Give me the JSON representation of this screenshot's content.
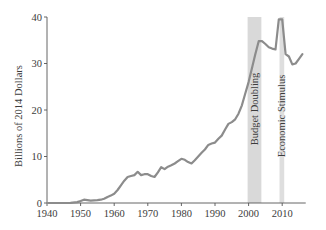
{
  "chart_data": {
    "type": "line",
    "title": "",
    "xlabel": "",
    "ylabel": "Billions of 2014 Dollars",
    "xlim": [
      1940,
      2017
    ],
    "ylim": [
      0,
      40
    ],
    "xticks": [
      1940,
      1950,
      1960,
      1970,
      1980,
      1990,
      2000,
      2010
    ],
    "yticks": [
      0,
      10,
      20,
      30,
      40
    ],
    "grid": false,
    "legend": null,
    "series": [
      {
        "name": "Spending",
        "color": "#8c8c8c",
        "x": [
          1940,
          1945,
          1947,
          1949,
          1950,
          1951,
          1953,
          1955,
          1956,
          1957,
          1958,
          1959,
          1960,
          1961,
          1962,
          1963,
          1964,
          1965,
          1966,
          1967,
          1968,
          1969,
          1970,
          1971,
          1972,
          1973,
          1974,
          1975,
          1976,
          1977,
          1978,
          1979,
          1980,
          1981,
          1982,
          1983,
          1984,
          1985,
          1986,
          1987,
          1988,
          1989,
          1990,
          1991,
          1992,
          1993,
          1994,
          1995,
          1996,
          1997,
          1998,
          1999,
          2000,
          2001,
          2002,
          2003,
          2004,
          2005,
          2006,
          2007,
          2008,
          2009,
          2010,
          2011,
          2012,
          2013,
          2014,
          2015,
          2016
        ],
        "values": [
          0.0,
          0.0,
          0.05,
          0.2,
          0.4,
          0.7,
          0.5,
          0.6,
          0.7,
          0.9,
          1.3,
          1.6,
          2.0,
          2.8,
          3.8,
          4.8,
          5.6,
          5.8,
          6.0,
          6.7,
          6.0,
          6.2,
          6.2,
          5.8,
          5.6,
          6.6,
          7.7,
          7.3,
          7.8,
          8.1,
          8.5,
          9.0,
          9.5,
          9.3,
          8.8,
          8.5,
          9.2,
          10.0,
          10.8,
          11.5,
          12.5,
          12.8,
          13.0,
          13.8,
          14.5,
          15.8,
          17.0,
          17.4,
          18.0,
          19.2,
          21.0,
          23.5,
          26.0,
          29.0,
          32.0,
          34.8,
          34.8,
          34.2,
          33.5,
          33.2,
          33.0,
          39.5,
          39.5,
          32.0,
          31.5,
          29.8,
          30.0,
          31.0,
          32.0
        ]
      }
    ],
    "annotations": [
      {
        "type": "shaded_band",
        "label": "Budget Doubling",
        "x_start": 1999.7,
        "x_end": 2003.8,
        "color": "#d9d9d9"
      },
      {
        "type": "shaded_band",
        "label": "Economic Stimulus",
        "x_start": 2009.2,
        "x_end": 2010.6,
        "color": "#dedede"
      }
    ]
  },
  "axes": {
    "ylabel": "Billions of 2014 Dollars",
    "y_tick_labels": [
      "0",
      "10",
      "20",
      "30",
      "40"
    ],
    "x_tick_labels": [
      "1940",
      "1950",
      "1960",
      "1970",
      "1980",
      "1990",
      "2000",
      "2010"
    ]
  },
  "bands": {
    "budget_doubling": "Budget Doubling",
    "economic_stimulus": "Economic Stimulus"
  }
}
